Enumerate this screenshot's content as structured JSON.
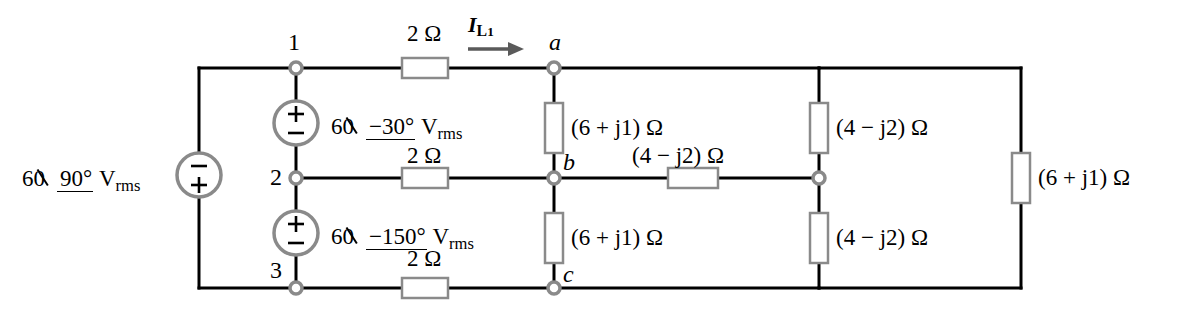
{
  "diagram": {
    "background": "#ffffff",
    "wire_color": "#000000",
    "component_color": "#8a8a8a",
    "arrow_color": "#5a5a5a"
  },
  "sources": [
    {
      "id": "source-left",
      "magnitude": "60",
      "angle": "90°",
      "unit": "V",
      "unit_sub": "rms",
      "label": "60 ∠90° V rms",
      "polarity_top": "−",
      "polarity_bottom": "+"
    },
    {
      "id": "source-node1-node2",
      "magnitude": "60",
      "angle": "−30°",
      "unit": "V",
      "unit_sub": "rms",
      "label": "60∠−30° V rms",
      "polarity_top": "+",
      "polarity_bottom": "−"
    },
    {
      "id": "source-node2-node3",
      "magnitude": "60",
      "angle": "−150°",
      "unit": "V",
      "unit_sub": "rms",
      "label": "60∠−150° V rms",
      "polarity_top": "+",
      "polarity_bottom": "−"
    }
  ],
  "nodes": [
    {
      "id": "node-1",
      "label": "1",
      "italic": false
    },
    {
      "id": "node-2",
      "label": "2",
      "italic": false
    },
    {
      "id": "node-3",
      "label": "3",
      "italic": false
    },
    {
      "id": "node-a",
      "label": "a",
      "italic": true
    },
    {
      "id": "node-b",
      "label": "b",
      "italic": true
    },
    {
      "id": "node-c",
      "label": "c",
      "italic": true
    }
  ],
  "current_labels": [
    {
      "id": "current-il1",
      "symbol": "I",
      "subscript": "L",
      "subscript2": "1",
      "label": "I L1",
      "direction": "right"
    }
  ],
  "line_resistors": [
    {
      "id": "line-res-top",
      "value": "2",
      "unit": "Ω",
      "label": "2 Ω"
    },
    {
      "id": "line-res-mid",
      "value": "2",
      "unit": "Ω",
      "label": "2 Ω"
    },
    {
      "id": "line-res-bot",
      "value": "2",
      "unit": "Ω",
      "label": "2 Ω"
    }
  ],
  "load_impedances": [
    {
      "id": "imp-ab",
      "real": "6",
      "sign": "+",
      "imag": "j1",
      "unit": "Ω",
      "label": "(6 + j1) Ω"
    },
    {
      "id": "imp-bc",
      "real": "6",
      "sign": "+",
      "imag": "j1",
      "unit": "Ω",
      "label": "(6 + j1) Ω"
    },
    {
      "id": "imp-b-right",
      "real": "4",
      "sign": "−",
      "imag": "j2",
      "unit": "Ω",
      "label": "(4 − j2) Ω"
    },
    {
      "id": "imp-right-top",
      "real": "4",
      "sign": "−",
      "imag": "j2",
      "unit": "Ω",
      "label": "(4 − j2) Ω"
    },
    {
      "id": "imp-right-bot",
      "real": "4",
      "sign": "−",
      "imag": "j2",
      "unit": "Ω",
      "label": "(4 − j2) Ω"
    },
    {
      "id": "imp-far-right",
      "real": "6",
      "sign": "+",
      "imag": "j1",
      "unit": "Ω",
      "label": "(6 + j1) Ω"
    }
  ]
}
